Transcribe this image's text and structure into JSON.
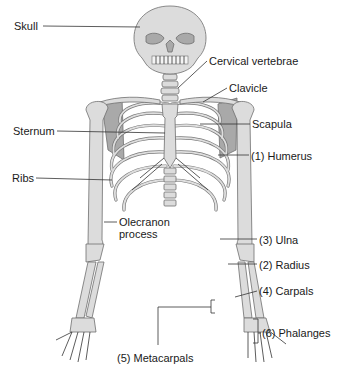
{
  "diagram": {
    "colors": {
      "bone_fill": "#dcdcdc",
      "bone_outline": "#6e6e6e",
      "scapula_shade": "#a9a9a9",
      "label_text": "#1a1a1a",
      "background": "#ffffff"
    },
    "labels": [
      {
        "id": "skull",
        "text": "Skull",
        "x": 14,
        "y": 20
      },
      {
        "id": "cervical-vertebrae",
        "text": "Cervical vertebrae",
        "x": 209,
        "y": 55
      },
      {
        "id": "clavicle",
        "text": "Clavicle",
        "x": 229,
        "y": 82
      },
      {
        "id": "sternum",
        "text": "Sternum",
        "x": 13,
        "y": 125
      },
      {
        "id": "scapula",
        "text": "Scapula",
        "x": 252,
        "y": 118
      },
      {
        "id": "humerus",
        "text": "(1) Humerus",
        "x": 251,
        "y": 150
      },
      {
        "id": "ribs",
        "text": "Ribs",
        "x": 12,
        "y": 172
      },
      {
        "id": "olecranon-1",
        "text": "Olecranon",
        "x": 119,
        "y": 216
      },
      {
        "id": "olecranon-2",
        "text": "process",
        "x": 119,
        "y": 228
      },
      {
        "id": "ulna",
        "text": "(3) Ulna",
        "x": 259,
        "y": 234
      },
      {
        "id": "radius",
        "text": "(2) Radius",
        "x": 259,
        "y": 259
      },
      {
        "id": "carpals",
        "text": "(4) Carpals",
        "x": 259,
        "y": 285
      },
      {
        "id": "phalanges",
        "text": "(6) Phalanges",
        "x": 262,
        "y": 327
      },
      {
        "id": "metacarpals",
        "text": "(5) Metacarpals",
        "x": 117,
        "y": 352
      }
    ]
  }
}
